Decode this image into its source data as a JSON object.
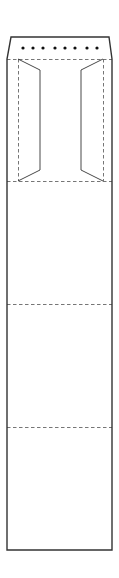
{
  "diagram": {
    "type": "dieline",
    "width": 119,
    "height": 578,
    "colors": {
      "background": "#ffffff",
      "cut_line": "#333333",
      "fold_line": "#666666",
      "perforation_dot": "#111111"
    },
    "outline": {
      "points": [
        [
          11,
          37
        ],
        [
          109,
          37
        ],
        [
          112,
          59
        ],
        [
          112,
          550
        ],
        [
          7,
          550
        ],
        [
          7,
          59
        ]
      ]
    },
    "perforation": {
      "y": 48,
      "x": [
        23,
        33,
        43,
        55,
        65,
        75,
        87,
        97
      ],
      "radius": 1.6
    },
    "fold_lines": {
      "horizontal_y": [
        59,
        181,
        304,
        427
      ],
      "left_vertical_x": 18,
      "right_vertical_x": 103,
      "vertical_span": [
        59,
        181
      ]
    },
    "side_flaps": [
      {
        "name": "left",
        "points": [
          [
            18,
            59
          ],
          [
            40,
            70
          ],
          [
            40,
            170
          ],
          [
            18,
            181
          ]
        ]
      },
      {
        "name": "right",
        "points": [
          [
            103,
            59
          ],
          [
            81,
            70
          ],
          [
            81,
            170
          ],
          [
            103,
            181
          ]
        ]
      }
    ]
  }
}
